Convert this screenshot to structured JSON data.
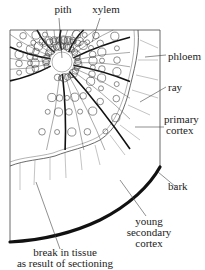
{
  "figure": {
    "kind": "labelled botanical diagram — transverse section of woody stem segment",
    "labels": {
      "pith": "pith",
      "xylem": "xylem",
      "phloem": "phloem",
      "ray": "ray",
      "primary_cortex_1": "primary",
      "primary_cortex_2": "cortex",
      "bark": "bark",
      "young_secondary_cortex_1": "young",
      "young_secondary_cortex_2": "secondary",
      "young_secondary_cortex_3": "cortex",
      "break_1": "break in tissue",
      "break_2": "as result of sectioning"
    },
    "colors": {
      "line": "#333333",
      "bark": "#111111",
      "background": "#ffffff"
    }
  }
}
